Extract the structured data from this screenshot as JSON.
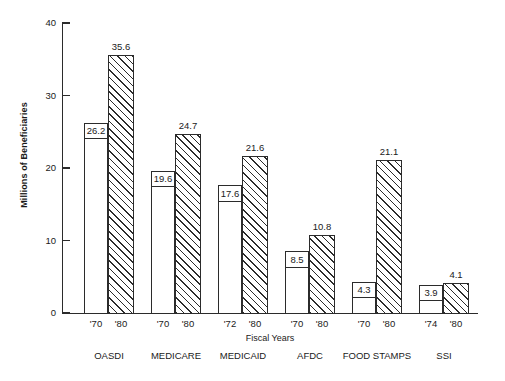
{
  "chart_data": {
    "type": "bar",
    "title": "",
    "subtitle": "",
    "xlabel": "Fiscal Years",
    "ylabel": "Millions of Beneficiaries",
    "ylim": [
      0,
      40
    ],
    "yticks": [
      0,
      10,
      20,
      30,
      40
    ],
    "ytick_labels": [
      "0",
      "10",
      "20",
      "30",
      "40"
    ],
    "grid": false,
    "legend": "none",
    "categories": [
      "OASDI",
      "MEDICARE",
      "MEDICAID",
      "AFDC",
      "FOOD STAMPS",
      "SSI"
    ],
    "series": [
      {
        "name": "Earlier fiscal year",
        "style": "white",
        "x_labels": [
          "'70",
          "'70",
          "'72",
          "'70",
          "'70",
          "'74"
        ],
        "values": [
          26.2,
          19.6,
          17.6,
          8.5,
          4.3,
          3.9
        ]
      },
      {
        "name": "1980",
        "style": "hatched",
        "x_labels": [
          "'80",
          "'80",
          "'80",
          "'80",
          "'80",
          "'80"
        ],
        "values": [
          35.6,
          24.7,
          21.6,
          10.8,
          21.1,
          4.1
        ]
      }
    ],
    "groups": [
      {
        "category": "OASDI",
        "bars": [
          {
            "year": "'70",
            "value": 26.2,
            "label": "26.2",
            "style": "white",
            "x": 84,
            "w": 24,
            "label_pos": "inside"
          },
          {
            "year": "'80",
            "value": 35.6,
            "label": "35.6",
            "style": "hatched",
            "x": 108,
            "w": 26,
            "label_pos": "above"
          }
        ]
      },
      {
        "category": "MEDICARE",
        "bars": [
          {
            "year": "'70",
            "value": 19.6,
            "label": "19.6",
            "style": "white",
            "x": 151,
            "w": 24,
            "label_pos": "inside"
          },
          {
            "year": "'80",
            "value": 24.7,
            "label": "24.7",
            "style": "hatched",
            "x": 175,
            "w": 26,
            "label_pos": "above"
          }
        ]
      },
      {
        "category": "MEDICAID",
        "bars": [
          {
            "year": "'72",
            "value": 17.6,
            "label": "17.6",
            "style": "white",
            "x": 218,
            "w": 24,
            "label_pos": "inside"
          },
          {
            "year": "'80",
            "value": 21.6,
            "label": "21.6",
            "style": "hatched",
            "x": 242,
            "w": 26,
            "label_pos": "above"
          }
        ]
      },
      {
        "category": "AFDC",
        "bars": [
          {
            "year": "'70",
            "value": 8.5,
            "label": "8.5",
            "style": "white",
            "x": 285,
            "w": 24,
            "label_pos": "inside"
          },
          {
            "year": "'80",
            "value": 10.8,
            "label": "10.8",
            "style": "hatched",
            "x": 309,
            "w": 26,
            "label_pos": "above"
          }
        ]
      },
      {
        "category": "FOOD STAMPS",
        "bars": [
          {
            "year": "'70",
            "value": 4.3,
            "label": "4.3",
            "style": "white",
            "x": 352,
            "w": 24,
            "label_pos": "inside"
          },
          {
            "year": "'80",
            "value": 21.1,
            "label": "21.1",
            "style": "hatched",
            "x": 376,
            "w": 26,
            "label_pos": "above"
          }
        ]
      },
      {
        "category": "SSI",
        "bars": [
          {
            "year": "'74",
            "value": 3.9,
            "label": "3.9",
            "style": "white",
            "x": 419,
            "w": 24,
            "label_pos": "inside"
          },
          {
            "year": "'80",
            "value": 4.1,
            "label": "4.1",
            "style": "hatched",
            "x": 443,
            "w": 26,
            "label_pos": "above"
          }
        ]
      }
    ]
  },
  "geometry": {
    "plot_left": 62,
    "plot_top": 23,
    "plot_bottom": 313,
    "axis_x_width": 416,
    "y_max": 40
  }
}
